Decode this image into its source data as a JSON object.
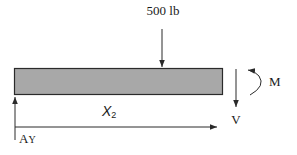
{
  "diagram": {
    "type": "free-body-diagram",
    "colors": {
      "beam_fill": "#a8a8a8",
      "beam_stroke": "#2a2a2a",
      "line": "#2a2a2a",
      "text": "#1a1a1a",
      "background": "#ffffff"
    },
    "beam": {
      "label": "beam"
    },
    "applied_load": {
      "label": "500 lb",
      "direction": "down"
    },
    "reaction": {
      "label_main": "A",
      "label_sub": "Y",
      "direction": "up"
    },
    "shear": {
      "label": "V",
      "direction": "down"
    },
    "moment": {
      "label": "M",
      "direction": "counterclockwise"
    },
    "position_axis": {
      "label_main": "X",
      "label_sub": "2"
    }
  }
}
